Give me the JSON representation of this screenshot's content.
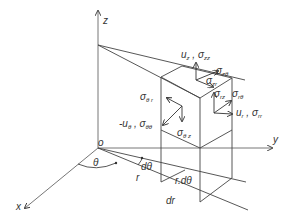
{
  "diagram": {
    "axes": {
      "z": "z",
      "y": "y",
      "x": "x",
      "origin": "o"
    },
    "angles": {
      "theta": "θ",
      "d_theta": "dθ"
    },
    "dimensions": {
      "r": "r",
      "r_dtheta": "r.dθ",
      "dr": "dr"
    },
    "labels": {
      "uz_szz": {
        "u": "u",
        "u_sub": "z",
        "sep": " , ",
        "s": "σ",
        "s_sub": "zz"
      },
      "s_ztheta": {
        "s": "σ",
        "s_sub": "zθ"
      },
      "s_zr": {
        "s": "σ",
        "s_sub": "zr"
      },
      "s_rz": {
        "s": "σ",
        "s_sub": "rz"
      },
      "s_rtheta": {
        "s": "σ",
        "s_sub": "rθ"
      },
      "ur_srr": {
        "u": "u",
        "u_sub": "r",
        "sep": " , ",
        "s": "σ",
        "s_sub": "rr"
      },
      "s_thetar": {
        "s": "σ",
        "s_sub": "θ r"
      },
      "utheta_stheta": {
        "u": "-u",
        "u_sub": "θ",
        "sep": " , ",
        "s": "σ",
        "s_sub": "θθ"
      },
      "s_thetaz": {
        "s": "σ",
        "s_sub": "θ z"
      }
    },
    "colors": {
      "line": "#444444",
      "axis": "#666666",
      "text": "#333333",
      "background": "#ffffff"
    }
  }
}
